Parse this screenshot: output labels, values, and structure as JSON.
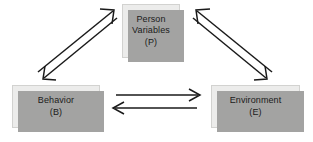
{
  "diagram": {
    "background_color": "#ffffff",
    "box_fill_color": "#ececeb",
    "box_border_color": "#d2d2d0",
    "box_shadow_color": "#a3a3a2",
    "arrow_color": "#1a1a1a",
    "nodes": [
      {
        "id": "person",
        "name": "person-variables-node",
        "line1": "Person",
        "line2": "Variables",
        "line3": "(P)",
        "abbreviation": "P"
      },
      {
        "id": "behavior",
        "name": "behavior-node",
        "line1": "Behavior",
        "line2": "(B)",
        "abbreviation": "B"
      },
      {
        "id": "environment",
        "name": "environment-node",
        "line1": "Environment",
        "line2": "(E)",
        "abbreviation": "E"
      }
    ],
    "connections": [
      {
        "id": "behavior-to-person",
        "from": "Behavior (B)",
        "to": "Person Variables (P)",
        "direction": "up-right"
      },
      {
        "id": "person-to-behavior",
        "from": "Person Variables (P)",
        "to": "Behavior (B)",
        "direction": "down-left"
      },
      {
        "id": "environment-to-person",
        "from": "Environment (E)",
        "to": "Person Variables (P)",
        "direction": "up-left"
      },
      {
        "id": "person-to-environment",
        "from": "Person Variables (P)",
        "to": "Environment (E)",
        "direction": "down-right"
      },
      {
        "id": "behavior-to-environment",
        "from": "Behavior (B)",
        "to": "Environment (E)",
        "direction": "right"
      },
      {
        "id": "environment-to-behavior",
        "from": "Environment (E)",
        "to": "Behavior (B)",
        "direction": "left"
      }
    ]
  }
}
